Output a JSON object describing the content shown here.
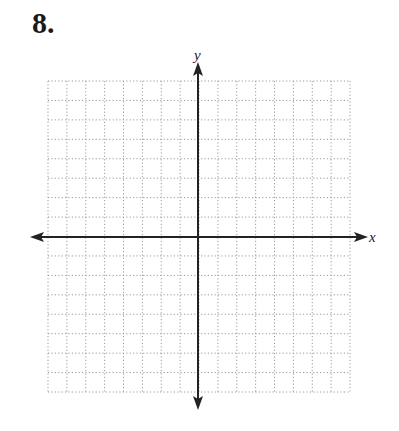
{
  "problem": {
    "number": "8."
  },
  "graph": {
    "x_axis_label": "x",
    "y_axis_label": "y",
    "grid": {
      "columns": 16,
      "rows": 16,
      "style": "dotted"
    },
    "colors": {
      "grid": "#9a9a9a",
      "axis": "#222222",
      "text": "#1a1a1a"
    }
  },
  "chart_data": {
    "type": "scatter",
    "title": "",
    "xlabel": "x",
    "ylabel": "y",
    "x": [],
    "y": [],
    "xlim": [
      -8,
      8
    ],
    "ylim": [
      -8,
      8
    ],
    "grid": true
  }
}
